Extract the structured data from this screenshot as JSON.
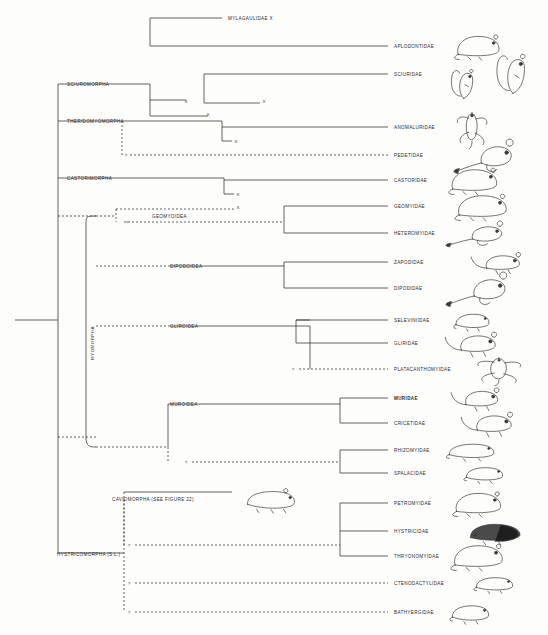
{
  "figure": {
    "background": "#fdfdfc",
    "line_color": "#3a3a3a"
  },
  "tips": [
    {
      "id": "mylagaulidae",
      "label": "MYLAGAULIDAE  X",
      "x": 228,
      "y": 18,
      "bold": false,
      "extinct": true,
      "animal": null
    },
    {
      "id": "aplodontidae",
      "label": "APLODONTIDAE",
      "x": 394,
      "y": 46,
      "bold": false,
      "extinct": false,
      "animal": "mountain-beaver"
    },
    {
      "id": "sciuridae",
      "label": "SCIURIDAE",
      "x": 394,
      "y": 74,
      "bold": false,
      "extinct": false,
      "animal": "squirrel"
    },
    {
      "id": "anomaluridae",
      "label": "ANOMALURIDAE",
      "x": 394,
      "y": 127,
      "bold": false,
      "extinct": false,
      "animal": "scaly-tailed-squirrel"
    },
    {
      "id": "pedetidae",
      "label": "PEDETIDAE",
      "x": 394,
      "y": 155,
      "bold": false,
      "extinct": false,
      "animal": "springhare"
    },
    {
      "id": "castoridae",
      "label": "CASTORIDAE",
      "x": 394,
      "y": 180,
      "bold": false,
      "extinct": false,
      "animal": "beaver"
    },
    {
      "id": "geomyidae",
      "label": "GEOMYIDAE",
      "x": 394,
      "y": 206,
      "bold": false,
      "extinct": false,
      "animal": "pocket-gopher"
    },
    {
      "id": "heteromyidae",
      "label": "HETEROMYIDAE",
      "x": 394,
      "y": 233,
      "bold": false,
      "extinct": false,
      "animal": "kangaroo-rat"
    },
    {
      "id": "zapodidae",
      "label": "ZAPODIDAE",
      "x": 394,
      "y": 262,
      "bold": false,
      "extinct": false,
      "animal": "jumping-mouse"
    },
    {
      "id": "dipodidae",
      "label": "DIPODIDAE",
      "x": 394,
      "y": 288,
      "bold": false,
      "extinct": false,
      "animal": "jerboa"
    },
    {
      "id": "seleviniidae",
      "label": "SELEVINIIDAE",
      "x": 394,
      "y": 320,
      "bold": false,
      "extinct": false,
      "animal": "desert-dormouse"
    },
    {
      "id": "gliridae",
      "label": "GLIRIDAE",
      "x": 394,
      "y": 343,
      "bold": false,
      "extinct": false,
      "animal": "dormouse"
    },
    {
      "id": "platacanthomyidae",
      "label": "PLATACANTHOMYIDAE",
      "x": 394,
      "y": 369,
      "bold": false,
      "extinct": false,
      "animal": "spiny-dormouse"
    },
    {
      "id": "muridae",
      "label": "MURIDAE",
      "x": 394,
      "y": 398,
      "bold": true,
      "extinct": false,
      "animal": "mouse"
    },
    {
      "id": "cricetidae",
      "label": "CRICETIDAE",
      "x": 394,
      "y": 423,
      "bold": false,
      "extinct": false,
      "animal": "hamster"
    },
    {
      "id": "rhizomyidae",
      "label": "RHIZOMYIDAE",
      "x": 394,
      "y": 450,
      "bold": false,
      "extinct": false,
      "animal": "bamboo-rat"
    },
    {
      "id": "spalacidae",
      "label": "SPALACIDAE",
      "x": 394,
      "y": 473,
      "bold": false,
      "extinct": false,
      "animal": "mole-rat"
    },
    {
      "id": "petromyidae",
      "label": "PETROMYIDAE",
      "x": 394,
      "y": 503,
      "bold": false,
      "extinct": false,
      "animal": "dassie-rat"
    },
    {
      "id": "hystricidae",
      "label": "HYSTRICIDAE",
      "x": 394,
      "y": 531,
      "bold": false,
      "extinct": false,
      "animal": "porcupine"
    },
    {
      "id": "thryonomyidae",
      "label": "THRYONOMYIDAE",
      "x": 394,
      "y": 556,
      "bold": false,
      "extinct": false,
      "animal": "cane-rat"
    },
    {
      "id": "ctenodactylidae",
      "label": "CTENODACTYLIDAE",
      "x": 394,
      "y": 583,
      "bold": false,
      "extinct": false,
      "animal": "gundi"
    },
    {
      "id": "bathyergidae",
      "label": "BATHYERGIDAE",
      "x": 394,
      "y": 612,
      "bold": false,
      "extinct": false,
      "animal": "blesmol"
    }
  ],
  "clades": [
    {
      "id": "sciuromorpha",
      "label": "SCIUROMORPHA",
      "x": 67,
      "y": 84
    },
    {
      "id": "theridomyomorpha",
      "label": "THERIDOMYOMORPHA",
      "x": 67,
      "y": 121
    },
    {
      "id": "castorimorpha",
      "label": "CASTORIMORPHA",
      "x": 67,
      "y": 178
    },
    {
      "id": "geomyoidea",
      "label": "GEOMYOIDEA",
      "x": 152,
      "y": 216
    },
    {
      "id": "dipodoidea",
      "label": "DIPODOIDEA",
      "x": 170,
      "y": 266
    },
    {
      "id": "gliroidea",
      "label": "GLIROIDEA",
      "x": 170,
      "y": 326
    },
    {
      "id": "muroidea",
      "label": "MUROIDEA",
      "x": 170,
      "y": 404
    },
    {
      "id": "caviomorpha",
      "label": "CAVIOMORPHA (SEE FIGURE 22)",
      "x": 112,
      "y": 499
    },
    {
      "id": "hystricomorpha",
      "label": "HYSTRICOMORPHA (S.L.)",
      "x": 57,
      "y": 554
    }
  ],
  "vertical_labels": [
    {
      "id": "myomorpha",
      "label": "MYOMORPHA",
      "x": 92,
      "y": 343
    }
  ],
  "extinct_marks": [
    {
      "id": "x-sciuro-1",
      "label": "X",
      "x": 186,
      "y": 101
    },
    {
      "id": "x-sciuro-2",
      "label": "X",
      "x": 264,
      "y": 101
    },
    {
      "id": "x-sciuro-3",
      "label": "X",
      "x": 208,
      "y": 114
    },
    {
      "id": "x-therido-1",
      "label": "X",
      "x": 236,
      "y": 141
    },
    {
      "id": "x-castor-1",
      "label": "X",
      "x": 238,
      "y": 194
    },
    {
      "id": "x-geomy-1",
      "label": "X",
      "x": 238,
      "y": 207
    }
  ],
  "uncertain_marks": [
    {
      "id": "q-pedetidae",
      "label": "?",
      "x": 126,
      "y": 155
    },
    {
      "id": "q-geomyoidea",
      "label": "?",
      "x": 127,
      "y": 222
    },
    {
      "id": "q-platacan",
      "label": "?",
      "x": 293,
      "y": 369
    },
    {
      "id": "q-rhizomy",
      "label": "?",
      "x": 186,
      "y": 462
    },
    {
      "id": "q-caviomorpha",
      "label": "?",
      "x": 129,
      "y": 545
    },
    {
      "id": "q-ctenodact",
      "label": "?",
      "x": 129,
      "y": 583
    },
    {
      "id": "q-bathyerg",
      "label": "?",
      "x": 129,
      "y": 612
    }
  ]
}
